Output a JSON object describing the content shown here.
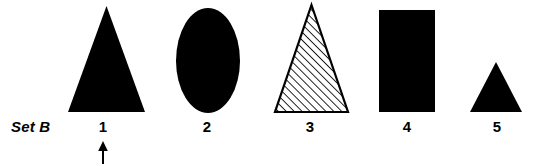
{
  "figure": {
    "set_label": "Set B",
    "width": 537,
    "height": 166,
    "background_color": "#ffffff",
    "ink_color": "#000000"
  },
  "items": [
    {
      "number": "1",
      "number_x": 103,
      "shape": "triangle",
      "fill": "solid-black",
      "fill_color": "#000000",
      "bbox": {
        "x": 68,
        "y": 6,
        "width": 77,
        "height": 106
      },
      "marked_by_arrow": true
    },
    {
      "number": "2",
      "number_x": 207,
      "shape": "ellipse",
      "fill": "solid-black",
      "fill_color": "#000000",
      "bbox": {
        "x": 176,
        "y": 8,
        "width": 64,
        "height": 105
      },
      "marked_by_arrow": false
    },
    {
      "number": "3",
      "number_x": 310,
      "shape": "triangle",
      "fill": "diagonal-hatch",
      "fill_color": "#ffffff",
      "stroke_color": "#000000",
      "hatch_angle_deg": 45,
      "hatch_spacing_px": 4,
      "bbox": {
        "x": 275,
        "y": 5,
        "width": 73,
        "height": 107
      },
      "marked_by_arrow": false
    },
    {
      "number": "4",
      "number_x": 407,
      "shape": "rectangle",
      "fill": "solid-black",
      "fill_color": "#000000",
      "bbox": {
        "x": 379,
        "y": 10,
        "width": 56,
        "height": 102
      },
      "marked_by_arrow": false
    },
    {
      "number": "5",
      "number_x": 497,
      "shape": "triangle",
      "fill": "solid-black",
      "fill_color": "#000000",
      "bbox": {
        "x": 470,
        "y": 62,
        "width": 52,
        "height": 50
      },
      "marked_by_arrow": false
    }
  ],
  "arrow": {
    "points_to_number": "1",
    "direction": "up",
    "x": 103,
    "tip_y": 143,
    "tail_y": 164
  }
}
